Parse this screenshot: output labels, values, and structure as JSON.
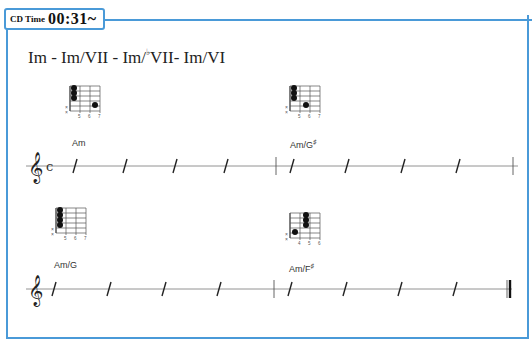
{
  "header": {
    "cd_label": "CD Time",
    "cd_time": "00:31~",
    "accent_color": "#4a9ad8"
  },
  "progression": {
    "part1": "Im - Im/VII - Im/",
    "flat_symbol": "♭",
    "part2": "VII- Im/VI"
  },
  "system1": {
    "time_signature": "c",
    "chords": [
      {
        "name": "Am",
        "accidental": "",
        "frets": [
          "5",
          "6",
          "7"
        ],
        "muted": [
          "x",
          "x"
        ]
      },
      {
        "name": "Am/G",
        "accidental": "♯",
        "frets": [
          "5",
          "6",
          "7"
        ],
        "muted": [
          "x",
          "x"
        ]
      }
    ],
    "slashes_per_bar": 4
  },
  "system2": {
    "chords": [
      {
        "name": "Am/G",
        "accidental": "",
        "frets": [
          "5",
          "6",
          "7"
        ],
        "muted": [
          "x",
          "x"
        ]
      },
      {
        "name": "Am/F",
        "accidental": "♯",
        "frets": [
          "4",
          "5",
          "6"
        ],
        "muted": [
          "x",
          "x"
        ]
      }
    ],
    "slashes_per_bar": 4,
    "end_barline": "final"
  },
  "clef": "𝄞"
}
